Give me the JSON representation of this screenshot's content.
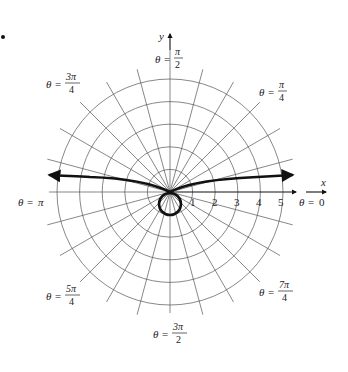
{
  "chart_data": {
    "type": "line",
    "subtype": "polar",
    "title": "",
    "axes": {
      "x_label": "x",
      "y_label": "y",
      "r_tick_labels": [
        "1",
        "2",
        "3",
        "4",
        "5"
      ],
      "r_max": 5,
      "rings": [
        1,
        2,
        3,
        4,
        5
      ],
      "spoke_step_deg": 15,
      "angle_labels": [
        {
          "angle": "0",
          "text_lhs": "θ = ",
          "num": "0",
          "den": ""
        },
        {
          "angle": "π/4",
          "text_lhs": "θ = ",
          "num": "π",
          "den": "4"
        },
        {
          "angle": "π/2",
          "text_lhs": "θ = ",
          "num": "π",
          "den": "2"
        },
        {
          "angle": "3π/4",
          "text_lhs": "θ = ",
          "num": "3π",
          "den": "4"
        },
        {
          "angle": "π",
          "text_lhs": "θ = ",
          "num": "π",
          "den": ""
        },
        {
          "angle": "5π/4",
          "text_lhs": "θ = ",
          "num": "5π",
          "den": "4"
        },
        {
          "angle": "3π/2",
          "text_lhs": "θ = ",
          "num": "3π",
          "den": "2"
        },
        {
          "angle": "7π/4",
          "text_lhs": "θ = ",
          "num": "7π",
          "den": "4"
        }
      ]
    },
    "series": [
      {
        "name": "curve",
        "approx_points_xy": [
          [
            -5.6,
            0.75
          ],
          [
            -4,
            0.65
          ],
          [
            -2,
            0.45
          ],
          [
            -1,
            0.3
          ],
          [
            0,
            0
          ],
          [
            1,
            0.3
          ],
          [
            2,
            0.45
          ],
          [
            4,
            0.6
          ],
          [
            5.6,
            0.7
          ]
        ],
        "loop": {
          "center_xy": [
            0,
            -0.5
          ],
          "radius": 0.5
        },
        "arrows_both_ends": true
      }
    ]
  },
  "labels": {
    "x_axis": "x",
    "y_axis": "y",
    "theta_eq": "θ =",
    "zero": "0",
    "pi": "π",
    "pi_over": "π",
    "three_pi": "3π",
    "five_pi": "5π",
    "seven_pi": "7π",
    "two": "2",
    "four": "4",
    "ticks": [
      "1",
      "2",
      "3",
      "4",
      "5"
    ]
  }
}
